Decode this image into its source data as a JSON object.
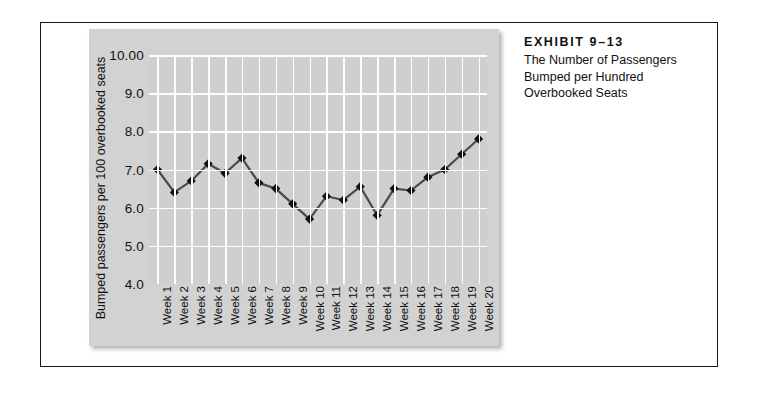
{
  "caption": {
    "exhibit_label": "EXHIBIT 9–13",
    "lines": [
      "The Number of Passengers",
      "Bumped per Hundred",
      "Overbooked Seats"
    ]
  },
  "chart_data": {
    "type": "line",
    "title": "",
    "xlabel": "",
    "ylabel": "Bumped passengers per 100 overbooked seats",
    "ylim": [
      4.0,
      10.0
    ],
    "ytick_labels": [
      "10.00",
      "9.0",
      "8.0",
      "7.0",
      "6.0",
      "5.0",
      "4.0"
    ],
    "ytick_values": [
      10.0,
      9.0,
      8.0,
      7.0,
      6.0,
      5.0,
      4.0
    ],
    "grid": "both",
    "legend": "none",
    "marker": "diamond",
    "line_color": "#4a4a4a",
    "marker_color": "#111111",
    "plot_background": "#cfcfcf",
    "gridline_color": "#fdfdfd",
    "categories": [
      "Week 1",
      "Week 2",
      "Week 3",
      "Week 4",
      "Week 5",
      "Week 6",
      "Week 7",
      "Week 8",
      "Week 9",
      "Week 10",
      "Week 11",
      "Week 12",
      "Week 13",
      "Week 14",
      "Week 15",
      "Week 16",
      "Week 17",
      "Week 18",
      "Week 19",
      "Week 20"
    ],
    "values": [
      7.0,
      6.4,
      6.7,
      7.15,
      6.9,
      7.3,
      6.65,
      6.5,
      6.1,
      5.7,
      6.3,
      6.2,
      6.55,
      5.8,
      6.5,
      6.45,
      6.8,
      7.0,
      7.4,
      7.8
    ]
  }
}
